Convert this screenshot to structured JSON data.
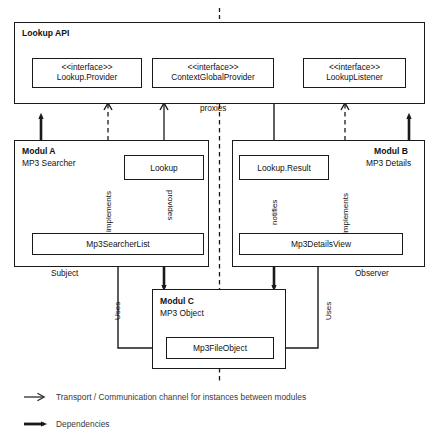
{
  "diagram": {
    "top_marker": "i",
    "api_container": {
      "label": "Lookup API",
      "interfaces": [
        {
          "stereotype": "<<interface>>",
          "name": "Lookup.Provider"
        },
        {
          "stereotype": "<<interface>>",
          "name": "ContextGlobalProvider"
        },
        {
          "stereotype": "<<interface>>",
          "name": "LookupListener"
        }
      ],
      "proxies_label": "proxies"
    },
    "module_a": {
      "title": "Modul A",
      "subtitle": "MP3 Searcher",
      "classes": [
        {
          "name": "Lookup"
        },
        {
          "name": "Mp3SearcherList"
        }
      ],
      "edge_labels": {
        "implements": "implements",
        "provides": "provides"
      },
      "role": "Subject"
    },
    "module_b": {
      "title": "Modul B",
      "subtitle": "MP3 Details",
      "classes": [
        {
          "name": "Lookup.Result"
        },
        {
          "name": "Mp3DetailsView"
        }
      ],
      "edge_labels": {
        "notifies": "notifies",
        "implements": "implements"
      },
      "role": "Observer"
    },
    "module_c": {
      "title": "Modul C",
      "subtitle": "MP3 Object",
      "classes": [
        {
          "name": "Mp3FileObject"
        }
      ]
    },
    "uses_labels": {
      "left": "Uses",
      "right": "Uses"
    },
    "legend": [
      {
        "icon": "thin-open-arrow-icon",
        "text": "Transport / Communication channel for instances between modules"
      },
      {
        "icon": "thick-solid-arrow-icon",
        "text": "Dependencies"
      }
    ],
    "colors": {
      "stroke": "#1a1a1a",
      "background": "#ffffff",
      "legend_text": "#3a3a3a"
    }
  }
}
